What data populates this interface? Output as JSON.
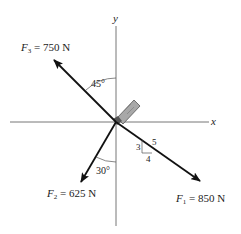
{
  "diagram": {
    "axes": {
      "x_label": "x",
      "y_label": "y"
    },
    "forces": [
      {
        "id": "F1",
        "symbol": "F",
        "subscript": "1",
        "magnitude": "850 N",
        "label": "F1 = 850 N"
      },
      {
        "id": "F2",
        "symbol": "F",
        "subscript": "2",
        "magnitude": "625 N",
        "label": "F2 = 625 N"
      },
      {
        "id": "F3",
        "symbol": "F",
        "subscript": "3",
        "magnitude": "750 N",
        "label": "F3 = 750 N"
      }
    ],
    "angles": {
      "f3_angle": "45°",
      "f2_angle": "30°"
    },
    "slope_triangle": {
      "rise": "3",
      "run": "4",
      "hyp": "5"
    },
    "eq": " = ",
    "colors": {
      "arrow": "#111111",
      "axis": "#666666",
      "bolt": "#9a9a9a"
    }
  }
}
